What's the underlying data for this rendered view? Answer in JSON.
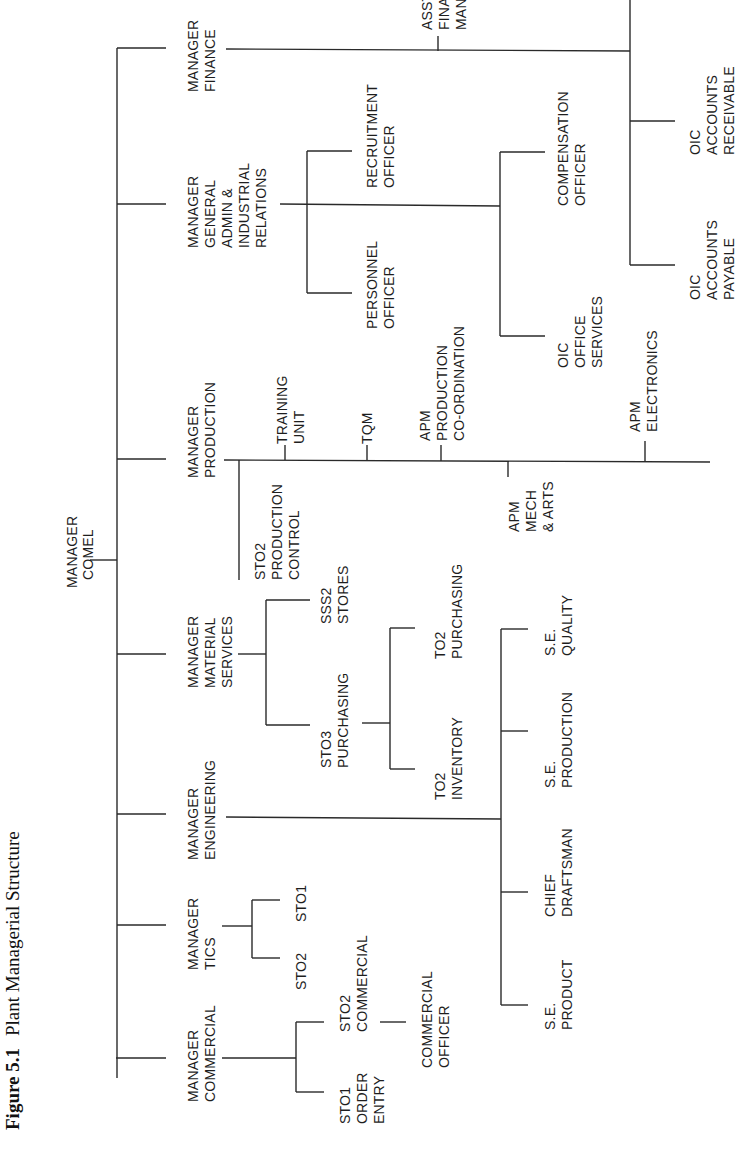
{
  "figure": {
    "number_label": "Figure 5.1",
    "title": "Plant Managerial Structure"
  },
  "org": {
    "root": {
      "lines": [
        "MANAGER",
        "COMEL"
      ]
    },
    "managers": [
      {
        "id": "finance",
        "lines": [
          "MANAGER",
          "FINANCE"
        ],
        "children": [
          {
            "lines": [
              "ASST",
              "FINANCE",
              "MANAGER"
            ]
          },
          {
            "lines": [
              "OIC",
              "ACCOUNTS",
              "RECEIVABLE"
            ]
          },
          {
            "lines": [
              "OIC",
              "ACCOUNTS",
              "PAYABLE"
            ]
          }
        ]
      },
      {
        "id": "general-admin",
        "lines": [
          "MANAGER",
          "GENERAL",
          "ADMIN &",
          "INDUSTRIAL",
          "RELATIONS"
        ],
        "children": [
          {
            "lines": [
              "RECRUITMENT",
              "OFFICER"
            ]
          },
          {
            "lines": [
              "PERSONNEL",
              "OFFICER"
            ]
          },
          {
            "lines": [
              "COMPENSATION",
              "OFFICER"
            ]
          },
          {
            "lines": [
              "OIC",
              "OFFICE",
              "SERVICES"
            ]
          }
        ]
      },
      {
        "id": "production",
        "lines": [
          "MANAGER",
          "PRODUCTION"
        ],
        "children": [
          {
            "lines": [
              "STO2",
              "PRODUCTION",
              "CONTROL"
            ]
          },
          {
            "lines": [
              "TRAINING",
              "UNIT"
            ]
          },
          {
            "lines": [
              "TQM"
            ]
          },
          {
            "lines": [
              "APM",
              "PRODUCTION",
              "CO-ORDINATION"
            ]
          },
          {
            "lines": [
              "APM",
              "MECH",
              "& ARTS"
            ]
          },
          {
            "lines": [
              "APM",
              "ELECTRONICS"
            ]
          }
        ]
      },
      {
        "id": "material-services",
        "lines": [
          "MANAGER",
          "MATERIAL",
          "SERVICES"
        ],
        "children": [
          {
            "lines": [
              "SSS2",
              "STORES"
            ]
          },
          {
            "lines": [
              "STO3",
              "PURCHASING"
            ]
          },
          {
            "lines": [
              "TO2",
              "PURCHASING"
            ]
          },
          {
            "lines": [
              "TO2",
              "INVENTORY"
            ]
          }
        ]
      },
      {
        "id": "engineering",
        "lines": [
          "MANAGER",
          "ENGINEERING"
        ],
        "children": [
          {
            "lines": [
              "S.E.",
              "QUALITY"
            ]
          },
          {
            "lines": [
              "S.E.",
              "PRODUCTION"
            ]
          },
          {
            "lines": [
              "CHIEF",
              "DRAFTSMAN"
            ]
          },
          {
            "lines": [
              "S.E.",
              "PRODUCT"
            ]
          }
        ]
      },
      {
        "id": "tics",
        "lines": [
          "MANAGER",
          "TICS"
        ],
        "children": [
          {
            "lines": [
              "STO1"
            ]
          },
          {
            "lines": [
              "STO2"
            ]
          }
        ]
      },
      {
        "id": "commercial",
        "lines": [
          "MANAGER",
          "COMMERCIAL"
        ],
        "children": [
          {
            "lines": [
              "STO2",
              "COMMERCIAL"
            ]
          },
          {
            "lines": [
              "STO1",
              "ORDER",
              "ENTRY"
            ]
          },
          {
            "lines": [
              "COMMERCIAL",
              "OFFICER"
            ]
          }
        ]
      }
    ]
  }
}
